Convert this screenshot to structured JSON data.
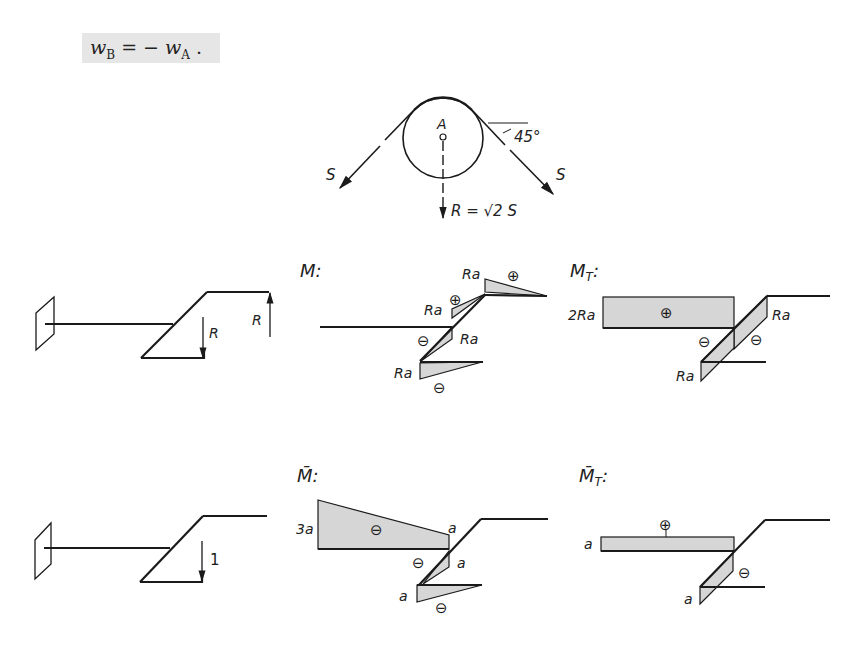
{
  "equation": {
    "lhs_var": "w",
    "lhs_sub": "B",
    "op": " = − ",
    "rhs_var": "w",
    "rhs_sub": "A",
    "trailing": " ."
  },
  "pulley": {
    "center_label": "A",
    "left_force": "S",
    "right_force": "S",
    "angle": "45°",
    "resultant": "R = √2 S"
  },
  "structure_loaded": {
    "load_down": "R",
    "load_up": "R"
  },
  "structure_unit": {
    "unit_load": "1"
  },
  "diagrams": {
    "M": {
      "title": "M:",
      "labels": [
        "Ra",
        "Ra",
        "Ra",
        "Ra"
      ],
      "signs": [
        "⊕",
        "⊕",
        "⊖",
        "⊖"
      ]
    },
    "MT": {
      "title": "M",
      "title_sub": "T",
      "title_colon": ":",
      "labels": [
        "2Ra",
        "Ra",
        "Ra"
      ],
      "signs": [
        "⊕",
        "⊖",
        "⊖"
      ]
    },
    "Mbar": {
      "title": "M̄:",
      "labels": [
        "3a",
        "a",
        "a",
        "a"
      ],
      "signs": [
        "⊖",
        "⊖",
        "⊖"
      ]
    },
    "MTbar": {
      "title": "M̄",
      "title_sub": "T",
      "title_colon": ":",
      "labels": [
        "a",
        "a"
      ],
      "signs": [
        "⊕",
        "⊖"
      ]
    }
  },
  "colors": {
    "line": "#1a1a1a",
    "fill": "#d6d6d6",
    "eq_bg": "#e6e6e6"
  }
}
